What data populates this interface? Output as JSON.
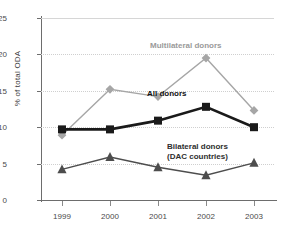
{
  "chart_data": {
    "type": "line",
    "title": "",
    "xlabel": "",
    "ylabel": "% of total ODA",
    "categories": [
      "1999",
      "2000",
      "2001",
      "2002",
      "2003"
    ],
    "ylim": [
      0,
      25
    ],
    "yticks": [
      "0",
      "5",
      "10",
      "15",
      "20",
      "25"
    ],
    "grid": true,
    "legend_position": "inline-annotations",
    "series": [
      {
        "name": "Multilateral donors",
        "label_line1": "Multilateral donors",
        "color": "#a6a6a6",
        "marker": "diamond",
        "values": [
          8.9,
          15.2,
          14.2,
          19.5,
          12.3
        ]
      },
      {
        "name": "All donors",
        "label_line1": "All donors",
        "color": "#1a1a1a",
        "marker": "square",
        "values": [
          9.7,
          9.7,
          10.9,
          12.8,
          10.0
        ]
      },
      {
        "name": "Bilateral donors (DAC countries)",
        "label_line1": "Bilateral donors",
        "label_line2": "(DAC countries)",
        "color": "#4d4d4d",
        "marker": "triangle",
        "values": [
          4.2,
          5.9,
          4.5,
          3.4,
          5.1
        ]
      }
    ]
  },
  "axis": {
    "y_title": "% of total ODA",
    "y_labels": [
      "25",
      "20",
      "15",
      "10",
      "5",
      "0"
    ],
    "x_labels": [
      "1999",
      "2000",
      "2001",
      "2002",
      "2003"
    ]
  },
  "labels": {
    "multilateral": "Multilateral donors",
    "all_donors": "All donors",
    "bilateral_line1": "Bilateral donors",
    "bilateral_line2": "(DAC countries)"
  }
}
